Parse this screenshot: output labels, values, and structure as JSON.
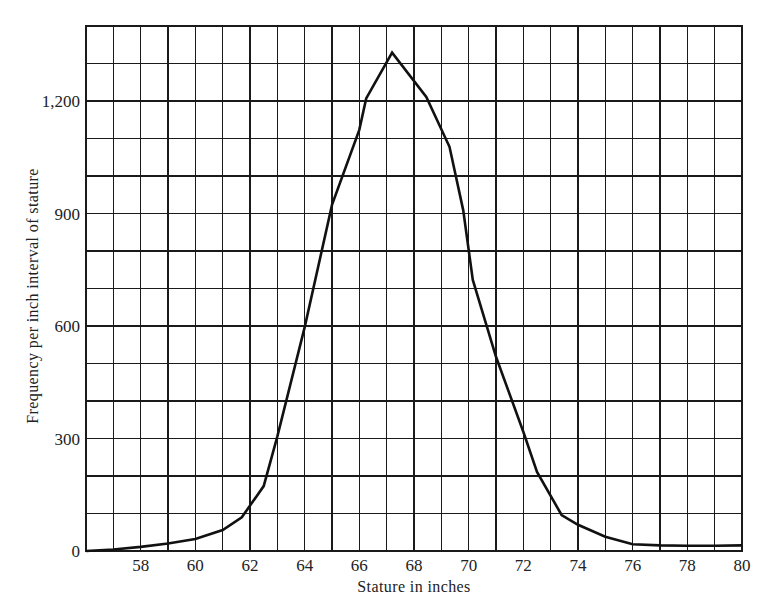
{
  "chart_data": {
    "type": "line",
    "title": "",
    "xlabel": "Stature in inches",
    "ylabel": "Frequency per inch interval of stature",
    "xlim": [
      56,
      80
    ],
    "ylim": [
      0,
      1400
    ],
    "grid": true,
    "x_grid_step": 1,
    "y_grid_step": 100,
    "x_ticks": [
      58,
      60,
      62,
      64,
      66,
      68,
      70,
      72,
      74,
      76,
      78,
      80
    ],
    "x_tick_labels": [
      "58",
      "60",
      "62",
      "64",
      "66",
      "68",
      "70",
      "72",
      "74",
      "76",
      "78",
      "80"
    ],
    "y_ticks": [
      0,
      300,
      600,
      900,
      1200
    ],
    "y_tick_labels": [
      "0",
      "300",
      "600",
      "900",
      "1,200"
    ],
    "legend": null,
    "series": [
      {
        "name": "Stature frequency",
        "x": [
          56,
          57,
          58,
          59,
          60,
          61,
          61.7,
          62.5,
          63,
          64,
          65,
          66,
          66.25,
          67.2,
          68.45,
          69.3,
          69.8,
          70.15,
          71,
          72,
          72.5,
          73.4,
          74,
          75,
          76,
          77,
          78,
          79,
          80
        ],
        "y": [
          0,
          4,
          11,
          20,
          32,
          56,
          90,
          173,
          305,
          597,
          923,
          1123,
          1207,
          1329,
          1211,
          1078,
          909,
          723,
          518,
          318,
          211,
          96,
          70,
          38,
          18,
          15,
          14,
          14,
          15
        ]
      }
    ]
  }
}
